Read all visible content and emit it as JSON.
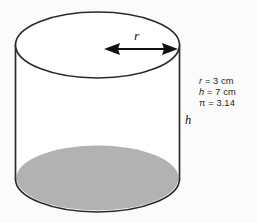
{
  "figure": {
    "shape": "cylinder",
    "labels": {
      "radius": "r",
      "height": "h"
    },
    "measurements": [
      {
        "symbol": "r",
        "text": "= 3 cm",
        "full": "r = 3 cm",
        "value": 3,
        "unit": "cm"
      },
      {
        "symbol": "h",
        "text": "= 7 cm",
        "full": "h = 7 cm",
        "value": 7,
        "unit": "cm"
      },
      {
        "symbol": "π",
        "text": "= 3.14",
        "full": "π = 3.14",
        "value": 3.14,
        "unit": ""
      }
    ],
    "colors": {
      "background": "#fbfbfb",
      "outline": "#2b2b2b",
      "shaded_base": "#b2b2b2",
      "text": "#1b1b1b"
    },
    "icons": {
      "radius_arrow": "double-headed-arrow-icon"
    }
  }
}
